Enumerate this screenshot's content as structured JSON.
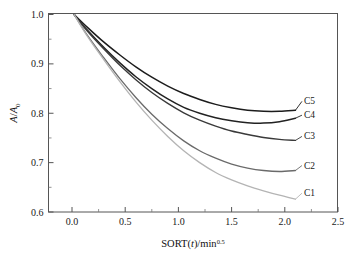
{
  "chart_data": {
    "type": "line",
    "title": "",
    "xlabel": "SORT(t)/min",
    "xlabel_exponent": "0.5",
    "ylabel_numerator": "A",
    "ylabel_denominator": "A",
    "ylabel_denominator_sub": "0",
    "ylabel": "A/A0",
    "xlim": [
      0.0,
      2.5
    ],
    "ylim": [
      0.6,
      1.0
    ],
    "grid": false,
    "legend_position": "inline-right-of-curve-ends",
    "x_ticks": [
      "0.0",
      "0.5",
      "1.0",
      "1.5",
      "2.0",
      "2.5"
    ],
    "x_tick_values": [
      0.0,
      0.5,
      1.0,
      1.5,
      2.0,
      2.5
    ],
    "x_minor_tick_values": [
      0.25,
      0.75,
      1.25,
      1.75,
      2.25
    ],
    "y_ticks": [
      "0.6",
      "0.7",
      "0.8",
      "0.9",
      "1.0"
    ],
    "y_tick_values": [
      0.6,
      0.7,
      0.8,
      0.9,
      1.0
    ],
    "y_minor_tick_values": [
      0.65,
      0.75,
      0.85,
      0.95
    ],
    "series": [
      {
        "name": "C5",
        "color": "#1c1c1c",
        "width": 1.5,
        "label": "C5",
        "label_x": 2.18,
        "label_y": 0.818,
        "x": [
          0.02,
          0.15,
          0.3,
          0.45,
          0.6,
          0.75,
          0.9,
          1.05,
          1.2,
          1.35,
          1.5,
          1.65,
          1.8,
          1.95,
          2.1
        ],
        "y": [
          1.0,
          0.973,
          0.944,
          0.918,
          0.894,
          0.873,
          0.855,
          0.84,
          0.828,
          0.818,
          0.811,
          0.806,
          0.804,
          0.804,
          0.806
        ]
      },
      {
        "name": "C4",
        "color": "#222222",
        "width": 1.5,
        "label": "C4",
        "label_x": 2.18,
        "label_y": 0.79,
        "x": [
          0.02,
          0.15,
          0.3,
          0.45,
          0.6,
          0.75,
          0.9,
          1.05,
          1.2,
          1.35,
          1.5,
          1.65,
          1.8,
          1.95,
          2.1
        ],
        "y": [
          1.0,
          0.967,
          0.933,
          0.902,
          0.874,
          0.85,
          0.829,
          0.812,
          0.8,
          0.791,
          0.785,
          0.781,
          0.78,
          0.783,
          0.79
        ]
      },
      {
        "name": "C3",
        "color": "#3a3a3a",
        "width": 1.4,
        "label": "C3",
        "label_x": 2.18,
        "label_y": 0.747,
        "x": [
          0.02,
          0.15,
          0.3,
          0.45,
          0.6,
          0.75,
          0.9,
          1.05,
          1.2,
          1.35,
          1.5,
          1.65,
          1.8,
          1.95,
          2.1
        ],
        "y": [
          1.0,
          0.965,
          0.93,
          0.897,
          0.868,
          0.842,
          0.82,
          0.801,
          0.786,
          0.774,
          0.764,
          0.757,
          0.751,
          0.747,
          0.745
        ]
      },
      {
        "name": "C2",
        "color": "#6a6a6a",
        "width": 1.3,
        "label": "C2",
        "label_x": 2.18,
        "label_y": 0.688,
        "x": [
          0.02,
          0.15,
          0.3,
          0.45,
          0.6,
          0.75,
          0.9,
          1.05,
          1.2,
          1.35,
          1.5,
          1.65,
          1.8,
          1.95,
          2.1
        ],
        "y": [
          1.0,
          0.956,
          0.912,
          0.87,
          0.832,
          0.798,
          0.769,
          0.744,
          0.724,
          0.709,
          0.697,
          0.689,
          0.684,
          0.682,
          0.684
        ]
      },
      {
        "name": "C1",
        "color": "#b4b4b4",
        "width": 1.3,
        "label": "C1",
        "label_x": 2.18,
        "label_y": 0.632,
        "x": [
          0.02,
          0.15,
          0.3,
          0.45,
          0.6,
          0.75,
          0.9,
          1.05,
          1.2,
          1.35,
          1.5,
          1.65,
          1.8,
          1.95,
          2.1
        ],
        "y": [
          1.0,
          0.954,
          0.908,
          0.864,
          0.823,
          0.786,
          0.753,
          0.724,
          0.7,
          0.68,
          0.665,
          0.653,
          0.643,
          0.634,
          0.626
        ]
      }
    ]
  }
}
